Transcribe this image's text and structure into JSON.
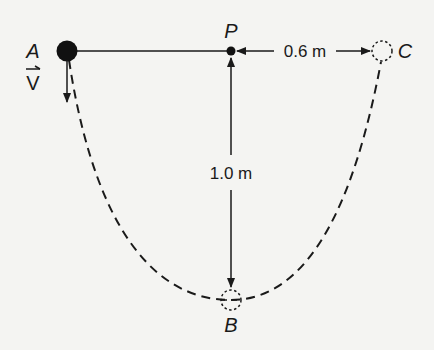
{
  "diagram": {
    "points": {
      "A": {
        "label": "A",
        "description": "solid ball at start"
      },
      "P": {
        "label": "P",
        "description": "pivot point"
      },
      "B": {
        "label": "B",
        "description": "lowest point (dashed circle)"
      },
      "C": {
        "label": "C",
        "description": "end position (dashed circle)"
      }
    },
    "velocity": {
      "label": "V",
      "vector_mark": "→",
      "direction": "down"
    },
    "measurements": {
      "horizontal": "0.6 m",
      "vertical": "1.0 m"
    },
    "colors": {
      "background": "#f4f4f2",
      "ink": "#1a1a1a"
    }
  }
}
